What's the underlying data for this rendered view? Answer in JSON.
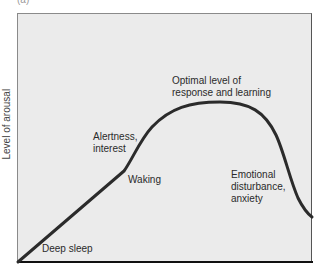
{
  "figure": {
    "panel_label": "(a)",
    "y_axis_label": "Level of arousal",
    "annotations": {
      "deep_sleep": "Deep sleep",
      "waking": "Waking",
      "alertness_line1": "Alertness,",
      "alertness_line2": "interest",
      "optimal_line1": "Optimal level of",
      "optimal_line2": "response and learning",
      "emotional_line1": "Emotional",
      "emotional_line2": "disturbance,",
      "emotional_line3": "anxiety"
    },
    "colors": {
      "plot_background": "#ebebeb",
      "curve": "#2b2b2b",
      "axis": "#111111"
    }
  }
}
